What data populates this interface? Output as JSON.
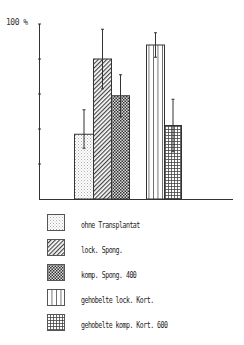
{
  "chart_data": {
    "type": "bar",
    "title": "",
    "xlabel": "",
    "ylabel": "100 %",
    "ylim": [
      0,
      100
    ],
    "yticks": [
      0,
      20,
      40,
      60,
      80,
      100
    ],
    "grid": false,
    "legend_position": "below",
    "categories": [
      "ohne Transplantat",
      "lock. Spong.",
      "komp. Spong. 400",
      "gehobelte lock. Kort.",
      "gehobelte komp. Kort. 600"
    ],
    "values": [
      37,
      80,
      59,
      88,
      42
    ],
    "error_low": [
      29,
      63,
      47,
      81,
      27
    ],
    "error_high": [
      51,
      97,
      71,
      95,
      57
    ],
    "groups": [
      {
        "name": "Spongiosa",
        "members": [
          0,
          1,
          2
        ]
      },
      {
        "name": "Kortikalis",
        "members": [
          3,
          4
        ]
      }
    ],
    "patterns": [
      "dots",
      "diagonal-hatch",
      "cross-hatch-dense",
      "vertical-lines",
      "grid"
    ]
  },
  "axis": {
    "y_label": "100 %"
  },
  "legend": {
    "items": [
      {
        "label": "ohne Transplantat",
        "pattern": "dots"
      },
      {
        "label": "lock. Spong.",
        "pattern": "diagonal-hatch"
      },
      {
        "label": "komp. Spong. 400",
        "pattern": "cross-hatch-dense"
      },
      {
        "label": "gehobelte lock. Kort.",
        "pattern": "vertical-lines"
      },
      {
        "label": "gehobelte komp. Kort. 600",
        "pattern": "grid"
      }
    ]
  }
}
